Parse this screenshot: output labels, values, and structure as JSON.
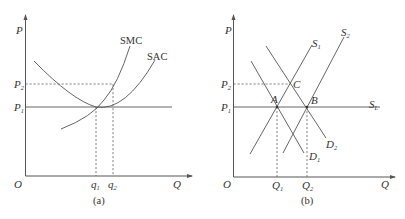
{
  "panel_a": {
    "caption": "(a)",
    "axis_y_label": "P",
    "axis_x_label": "Q",
    "origin_label": "O",
    "price_labels": [
      {
        "main": "P",
        "sub": "2"
      },
      {
        "main": "P",
        "sub": "1"
      }
    ],
    "quantity_labels": [
      {
        "main": "q",
        "sub": "1"
      },
      {
        "main": "q",
        "sub": "2"
      }
    ],
    "curve_labels": {
      "smc": "SMC",
      "sac": "SAC"
    }
  },
  "panel_b": {
    "caption": "(b)",
    "axis_y_label": "P",
    "axis_x_label": "Q",
    "origin_label": "O",
    "price_labels": [
      {
        "main": "P",
        "sub": "2"
      },
      {
        "main": "P",
        "sub": "1"
      }
    ],
    "quantity_labels": [
      {
        "main": "Q",
        "sub": "1"
      },
      {
        "main": "Q",
        "sub": "2"
      }
    ],
    "curve_labels": {
      "s1": {
        "main": "S",
        "sub": "1"
      },
      "s2": {
        "main": "S",
        "sub": "2"
      },
      "sl": {
        "main": "S",
        "sub": "L"
      },
      "d1": {
        "main": "D",
        "sub": "1"
      },
      "d2": {
        "main": "D",
        "sub": "2"
      }
    },
    "point_labels": {
      "a": "A",
      "b": "B",
      "c": "C"
    }
  }
}
